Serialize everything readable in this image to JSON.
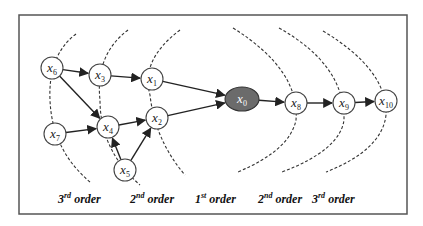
{
  "diagram": {
    "frame": {
      "x": 19,
      "y": 15,
      "w": 388,
      "h": 199,
      "stroke": "#555555"
    },
    "colors": {
      "center_fill": "#6b6b6b",
      "node_fill": "#ffffff",
      "edge": "#222222"
    },
    "nodes": [
      {
        "id": "x6",
        "base": "x",
        "sub": "6",
        "cx": 52,
        "cy": 68
      },
      {
        "id": "x3",
        "base": "x",
        "sub": "3",
        "cx": 100,
        "cy": 75
      },
      {
        "id": "x1",
        "base": "x",
        "sub": "1",
        "cx": 152,
        "cy": 79
      },
      {
        "id": "x0",
        "base": "x",
        "sub": "0",
        "cx": 242,
        "cy": 99,
        "center": true
      },
      {
        "id": "x8",
        "base": "x",
        "sub": "8",
        "cx": 296,
        "cy": 103
      },
      {
        "id": "x9",
        "base": "x",
        "sub": "9",
        "cx": 344,
        "cy": 103
      },
      {
        "id": "x10",
        "base": "x",
        "sub": "10",
        "cx": 386,
        "cy": 101
      },
      {
        "id": "x7",
        "base": "x",
        "sub": "7",
        "cx": 55,
        "cy": 134
      },
      {
        "id": "x4",
        "base": "x",
        "sub": "4",
        "cx": 108,
        "cy": 127
      },
      {
        "id": "x2",
        "base": "x",
        "sub": "2",
        "cx": 157,
        "cy": 118
      },
      {
        "id": "x5",
        "base": "x",
        "sub": "5",
        "cx": 125,
        "cy": 170
      }
    ],
    "edges": [
      [
        "x6",
        "x3"
      ],
      [
        "x3",
        "x1"
      ],
      [
        "x1",
        "x0"
      ],
      [
        "x6",
        "x4"
      ],
      [
        "x7",
        "x4"
      ],
      [
        "x5",
        "x4"
      ],
      [
        "x5",
        "x2"
      ],
      [
        "x4",
        "x2"
      ],
      [
        "x2",
        "x0"
      ],
      [
        "x0",
        "x8"
      ],
      [
        "x8",
        "x9"
      ],
      [
        "x9",
        "x10"
      ]
    ],
    "order_labels": [
      {
        "num": "3",
        "sup": "rd",
        "text": " order",
        "x": 58,
        "y": 203
      },
      {
        "num": "2",
        "sup": "nd",
        "text": " order",
        "x": 130,
        "y": 203
      },
      {
        "num": "1",
        "sup": "st",
        "text": " order",
        "x": 195,
        "y": 203
      },
      {
        "num": "2",
        "sup": "nd",
        "text": " order",
        "x": 258,
        "y": 203
      },
      {
        "num": "3",
        "sup": "rd",
        "text": " order",
        "x": 312,
        "y": 203
      }
    ]
  }
}
